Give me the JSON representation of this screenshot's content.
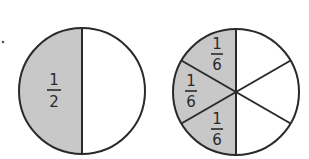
{
  "figure": {
    "colors": {
      "shaded": "#c8c8c8",
      "unshaded": "#ffffff",
      "stroke": "#2a2a2a"
    },
    "circles": [
      {
        "name": "halves-circle",
        "parts": 2,
        "shaded_parts": 1,
        "labels": [
          {
            "numerator": "1",
            "denominator": "2"
          }
        ]
      },
      {
        "name": "sixths-circle",
        "parts": 6,
        "shaded_parts": 3,
        "labels": [
          {
            "numerator": "1",
            "denominator": "6"
          },
          {
            "numerator": "1",
            "denominator": "6"
          },
          {
            "numerator": "1",
            "denominator": "6"
          }
        ]
      }
    ]
  }
}
